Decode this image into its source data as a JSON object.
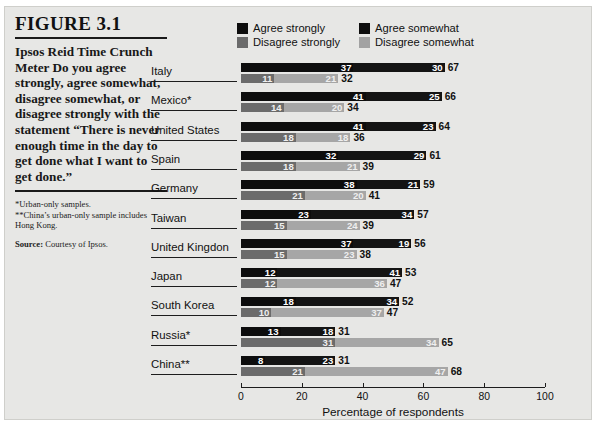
{
  "figure": {
    "number": "FIGURE 3.1",
    "title": "Ipsos Reid Time Crunch Meter",
    "caption": "Do you agree strongly, agree somewhat, disagree somewhat, or disagree strongly with the statement “There is never enough time in the day to get done what I want to get done.”",
    "footnote1": "*Urban-only samples.",
    "footnote2": "**China’s urban-only sample includes Hong Kong.",
    "source_label": "Source:",
    "source_text": " Courtesy of Ipsos."
  },
  "legend": [
    {
      "label": "Agree strongly",
      "color": "#0d0d0d"
    },
    {
      "label": "Agree somewhat",
      "color": "#0d0d0d"
    },
    {
      "label": "Disagree strongly",
      "color": "#6b6b6b"
    },
    {
      "label": "Disagree somewhat",
      "color": "#a2a2a2"
    }
  ],
  "colors": {
    "agree_strongly": "#0d0d0d",
    "agree_somewhat": "#141414",
    "disagree_strongly": "#6b6b6b",
    "disagree_somewhat": "#a6a6a6",
    "panel_bg": "#e7e7e5",
    "ink": "#111111"
  },
  "chart_data": {
    "type": "bar",
    "orientation": "horizontal",
    "stacked": true,
    "title": "Ipsos Reid Time Crunch Meter",
    "xlabel": "Percentage of respondents",
    "ylabel": "",
    "xlim": [
      0,
      100
    ],
    "xticks": [
      0,
      20,
      40,
      60,
      80,
      100
    ],
    "grid": false,
    "legend_position": "top",
    "categories": [
      "Italy",
      "Mexico*",
      "United States",
      "Spain",
      "Germany",
      "Taiwan",
      "United Kingdon",
      "Japan",
      "South Korea",
      "Russia*",
      "China**"
    ],
    "series": [
      {
        "name": "Agree strongly",
        "values": [
          37,
          41,
          41,
          32,
          38,
          23,
          37,
          12,
          18,
          13,
          8
        ]
      },
      {
        "name": "Agree somewhat",
        "values": [
          30,
          25,
          23,
          29,
          21,
          34,
          19,
          41,
          34,
          18,
          23
        ]
      },
      {
        "name": "Disagree strongly",
        "values": [
          11,
          14,
          18,
          18,
          21,
          15,
          15,
          12,
          10,
          31,
          21
        ]
      },
      {
        "name": "Disagree somewhat",
        "values": [
          21,
          20,
          18,
          21,
          20,
          24,
          23,
          36,
          37,
          34,
          47
        ]
      }
    ],
    "totals": {
      "agree": [
        67,
        66,
        64,
        61,
        59,
        57,
        56,
        53,
        52,
        31,
        31
      ],
      "disagree": [
        32,
        34,
        36,
        39,
        41,
        39,
        38,
        47,
        47,
        65,
        68
      ]
    }
  }
}
